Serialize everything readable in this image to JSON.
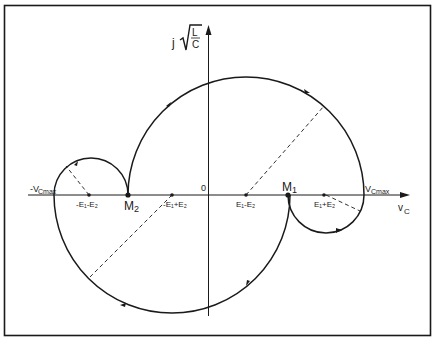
{
  "diagram": {
    "type": "phase-plane trajectory",
    "axes": {
      "x_label": "v",
      "x_label_sub": "C",
      "y_label_prefix": "j",
      "y_label_sqrt_num": "L",
      "y_label_sqrt_den": "C",
      "origin_label": "0"
    },
    "points": {
      "neg_vcmax": {
        "label": "-V",
        "sub": "Cmax"
      },
      "neg_e1_minus_e2": {
        "label": "-E₁-E₂"
      },
      "m2": {
        "label": "M",
        "sub": "2"
      },
      "neg_e1_plus_e2": {
        "label": "-E₁+E₂"
      },
      "e1_minus_e2": {
        "label": "E₁-E₂"
      },
      "m1": {
        "label": "M",
        "sub": "1"
      },
      "e1_plus_e2": {
        "label": "E₁+E₂"
      },
      "vcmax": {
        "label": "V",
        "sub": "Cmax"
      }
    },
    "colors": {
      "line": "#1a1a1a",
      "background": "#ffffff"
    }
  }
}
